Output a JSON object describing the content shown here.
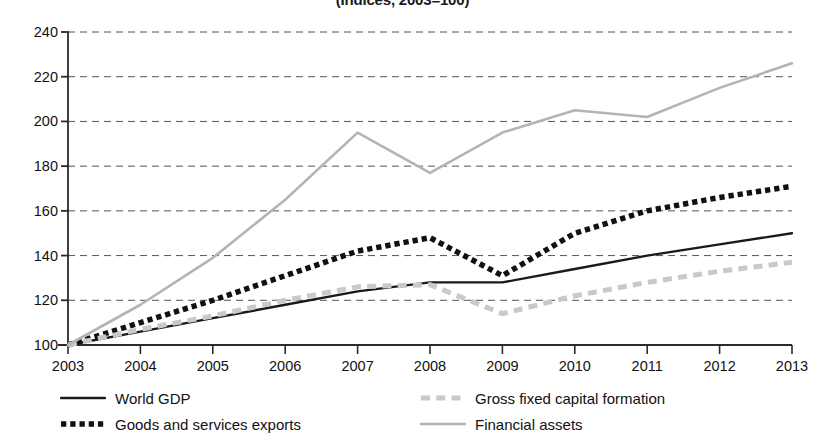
{
  "chart_data": {
    "type": "line",
    "title": "(Indices, 2003=100)",
    "xlabel": "",
    "ylabel": "",
    "x": [
      2003,
      2004,
      2005,
      2006,
      2007,
      2008,
      2009,
      2010,
      2011,
      2012,
      2013
    ],
    "xtick_labels": [
      "2003",
      "2004",
      "2005",
      "2006",
      "2007",
      "2008",
      "2009",
      "2010",
      "2011",
      "2012",
      "2013"
    ],
    "ytick_labels": [
      "100",
      "120",
      "140",
      "160",
      "180",
      "200",
      "220",
      "240"
    ],
    "yticks": [
      100,
      120,
      140,
      160,
      180,
      200,
      220,
      240
    ],
    "ylim": [
      100,
      240
    ],
    "xlim": [
      2003,
      2013
    ],
    "grid": "horizontal-dashed",
    "legend_position": "bottom",
    "series": [
      {
        "name": "World GDP",
        "style": "solid",
        "color": "#1a1a1a",
        "width": 2.4,
        "values": [
          100,
          106,
          112,
          118,
          124,
          128,
          128,
          134,
          140,
          145,
          150
        ]
      },
      {
        "name": "Goods and services exports",
        "style": "dotted-thick",
        "color": "#111111",
        "width": 5.5,
        "values": [
          100,
          110,
          120,
          131,
          142,
          148,
          131,
          150,
          160,
          166,
          171
        ]
      },
      {
        "name": "Gross fixed capital formation",
        "style": "dashed",
        "color": "#c9c9c9",
        "width": 5,
        "values": [
          100,
          107,
          113,
          120,
          126,
          127,
          114,
          122,
          128,
          133,
          137
        ]
      },
      {
        "name": "Financial assets",
        "style": "solid",
        "color": "#b4b4b4",
        "width": 2.6,
        "values": [
          100,
          118,
          139,
          165,
          195,
          177,
          195,
          205,
          202,
          215,
          226
        ]
      }
    ],
    "legend_order": [
      0,
      2,
      1,
      3
    ]
  },
  "colors": {
    "axis": "#2b2b2b",
    "grid": "#555555",
    "background": "#ffffff"
  }
}
